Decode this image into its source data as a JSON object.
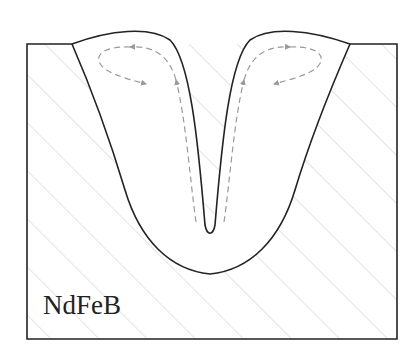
{
  "diagram": {
    "type": "weld cross-section (keyhole mode) with melt-pool flow",
    "material_label": "NdFeB",
    "colors": {
      "outline": "#222222",
      "hatch": "#c8c8c8",
      "flow_arrows": "#9a9a9a",
      "background": "#ffffff"
    },
    "elements": [
      "base-metal-block (hatched)",
      "fusion-zone (white)",
      "keyhole (narrow V)",
      "left-recirculation-loop (dashed arrows)",
      "right-recirculation-loop (dashed arrows)",
      "upward flow arrows along keyhole walls"
    ]
  }
}
